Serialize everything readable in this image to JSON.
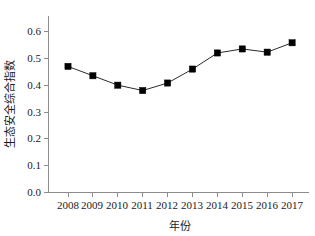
{
  "chart_data": {
    "type": "line",
    "title": "",
    "xlabel": "年份",
    "ylabel": "生态安全综合指数",
    "categories": [
      "2008",
      "2009",
      "2010",
      "2011",
      "2012",
      "2013",
      "2014",
      "2015",
      "2016",
      "2017"
    ],
    "x": [
      2008,
      2009,
      2010,
      2011,
      2012,
      2013,
      2014,
      2015,
      2016,
      2017
    ],
    "values": [
      0.47,
      0.435,
      0.4,
      0.38,
      0.408,
      0.46,
      0.52,
      0.535,
      0.523,
      0.558
    ],
    "series": [
      {
        "name": "生态安全综合指数",
        "values": [
          0.47,
          0.435,
          0.4,
          0.38,
          0.408,
          0.46,
          0.52,
          0.535,
          0.523,
          0.558
        ],
        "marker": "filled-square",
        "marker_color": "#000000",
        "line_color": "#2b2b2b"
      }
    ],
    "ylim": [
      0.0,
      0.65
    ],
    "yticks": [
      0.0,
      0.1,
      0.2,
      0.3,
      0.4,
      0.5,
      0.6
    ],
    "ytick_labels": [
      "0.0",
      "0.1",
      "0.2",
      "0.3",
      "0.4",
      "0.5",
      "0.6"
    ],
    "xtick_labels": [
      "2008",
      "2009",
      "2010",
      "2011",
      "2012",
      "2013",
      "2014",
      "2015",
      "2016",
      "2017"
    ],
    "grid": false,
    "legend": "none",
    "spines": [
      "left",
      "bottom"
    ],
    "tick_direction": "out",
    "axis_color": "#8c8c8c"
  },
  "axes": {
    "y_label": "生态安全综合指数",
    "x_label": "年份",
    "y_ticks": [
      "0.0",
      "0.1",
      "0.2",
      "0.3",
      "0.4",
      "0.5",
      "0.6"
    ],
    "x_ticks": [
      "2008",
      "2009",
      "2010",
      "2011",
      "2012",
      "2013",
      "2014",
      "2015",
      "2016",
      "2017"
    ]
  }
}
